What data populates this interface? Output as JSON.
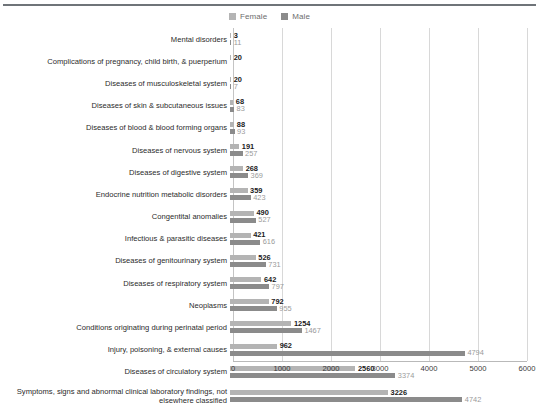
{
  "legend": {
    "items": [
      {
        "label": "Female",
        "color": "#b4b4b4",
        "name": "female"
      },
      {
        "label": "Male",
        "color": "#8b8b8b",
        "name": "male"
      }
    ]
  },
  "chart_data": {
    "type": "bar",
    "orientation": "horizontal",
    "title": "",
    "xlabel": "",
    "ylabel": "",
    "xlim": [
      0,
      6000
    ],
    "xticks": [
      0,
      1000,
      2000,
      3000,
      4000,
      5000,
      6000
    ],
    "xtick_labels": [
      "0",
      "1000",
      "2000",
      "3000",
      "4000",
      "5000",
      "6000"
    ],
    "grid": true,
    "legend_position": "top-center",
    "categories": [
      "Mental disorders",
      "Complications of pregnancy, child birth, & puerperium",
      "Diseases of musculoskeletal system",
      "Diseases of skin & subcutaneous issues",
      "Diseases of blood & blood forming organs",
      "Diseases of nervous system",
      "Diseases of digestive system",
      "Endocrine nutrition metabolic disorders",
      "Congentital anomalies",
      "Infectious & parasitic diseases",
      "Diseases of genitourinary system",
      "Diseases of respiratory system",
      "Neoplasms",
      "Conditions originating during perinatal period",
      "Injury, poisoning, & external causes",
      "Diseases of circulatory system",
      "Symptoms, signs and abnormal clinical laboratory findings, not\nelsewhere classified"
    ],
    "series": [
      {
        "name": "Female",
        "color": "#b4b4b4",
        "values": [
          3,
          20,
          20,
          68,
          88,
          191,
          268,
          359,
          490,
          421,
          526,
          642,
          792,
          1254,
          962,
          2560,
          3226
        ]
      },
      {
        "name": "Male",
        "color": "#8b8b8b",
        "values": [
          11,
          null,
          7,
          83,
          93,
          257,
          369,
          423,
          527,
          616,
          731,
          797,
          955,
          1467,
          4794,
          3374,
          4742
        ]
      }
    ]
  }
}
